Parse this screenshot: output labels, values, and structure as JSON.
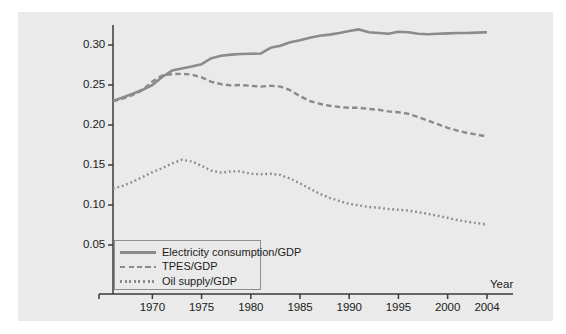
{
  "chart_data": {
    "type": "line",
    "title": "",
    "xlabel": "Year",
    "ylabel": "",
    "xlim": [
      1966,
      2004
    ],
    "ylim": [
      0.02,
      0.328
    ],
    "grid": false,
    "legend_position": "bottom-left",
    "xticks": [
      "1970",
      "1975",
      "1980",
      "1985",
      "1990",
      "1995",
      "2000",
      "2004"
    ],
    "xtick_values": [
      1970,
      1975,
      1980,
      1985,
      1990,
      1995,
      2000,
      2004
    ],
    "yticks": [
      "0.05",
      "0.10",
      "0.15",
      "0.20",
      "0.25",
      "0.30"
    ],
    "ytick_values": [
      0.05,
      0.1,
      0.15,
      0.2,
      0.25,
      0.3
    ],
    "x": [
      1966,
      1967,
      1968,
      1969,
      1970,
      1971,
      1972,
      1973,
      1974,
      1975,
      1976,
      1977,
      1978,
      1979,
      1980,
      1981,
      1982,
      1983,
      1984,
      1985,
      1986,
      1987,
      1988,
      1989,
      1990,
      1991,
      1992,
      1993,
      1994,
      1995,
      1996,
      1997,
      1998,
      1999,
      2000,
      2001,
      2002,
      2003,
      2004
    ],
    "series": [
      {
        "name": "Electricity consumption/GDP",
        "style": "solid",
        "color": "#8a8b8a",
        "values": [
          0.23,
          0.2345,
          0.239,
          0.244,
          0.25,
          0.26,
          0.268,
          0.2705,
          0.273,
          0.276,
          0.2835,
          0.2865,
          0.288,
          0.2888,
          0.289,
          0.2893,
          0.2965,
          0.299,
          0.3035,
          0.306,
          0.309,
          0.3115,
          0.313,
          0.315,
          0.3175,
          0.3195,
          0.316,
          0.315,
          0.314,
          0.3165,
          0.316,
          0.314,
          0.3135,
          0.314,
          0.3145,
          0.315,
          0.315,
          0.3155,
          0.316
        ]
      },
      {
        "name": "TPES/GDP",
        "style": "dashed",
        "color": "#8a8b8a",
        "values": [
          0.2295,
          0.233,
          0.2375,
          0.2435,
          0.2545,
          0.262,
          0.2635,
          0.264,
          0.263,
          0.2595,
          0.254,
          0.251,
          0.2495,
          0.25,
          0.249,
          0.248,
          0.249,
          0.248,
          0.2435,
          0.236,
          0.23,
          0.2265,
          0.224,
          0.2225,
          0.2215,
          0.2215,
          0.22,
          0.219,
          0.217,
          0.216,
          0.214,
          0.21,
          0.2055,
          0.201,
          0.1965,
          0.193,
          0.19,
          0.188,
          0.1855
        ]
      },
      {
        "name": "Oil supply/GDP",
        "style": "dotted",
        "color": "#8a8b8a",
        "values": [
          0.1205,
          0.124,
          0.129,
          0.135,
          0.141,
          0.146,
          0.152,
          0.1565,
          0.1545,
          0.149,
          0.143,
          0.1405,
          0.142,
          0.142,
          0.139,
          0.1385,
          0.139,
          0.1375,
          0.133,
          0.127,
          0.1205,
          0.114,
          0.109,
          0.105,
          0.1015,
          0.0995,
          0.0975,
          0.0965,
          0.095,
          0.094,
          0.093,
          0.091,
          0.089,
          0.0865,
          0.084,
          0.081,
          0.079,
          0.0775,
          0.0755
        ]
      }
    ]
  },
  "legend": {
    "items": [
      {
        "label": "Electricity consumption/GDP",
        "style": "solid"
      },
      {
        "label": "TPES/GDP",
        "style": "dashed"
      },
      {
        "label": "Oil supply/GDP",
        "style": "dotted"
      }
    ]
  },
  "colors": {
    "panel_background": "#e9eae9",
    "line": "#8a8b8a",
    "axis": "#3a3a3a",
    "text": "#1c1c1c"
  }
}
